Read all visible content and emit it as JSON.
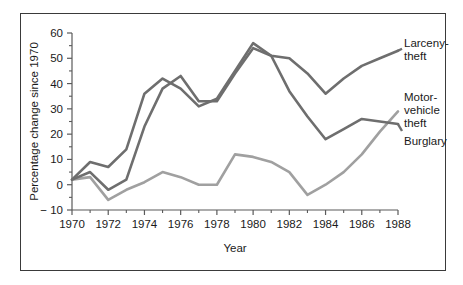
{
  "chart_data": {
    "type": "line",
    "title": "",
    "xlabel": "Year",
    "ylabel": "Percentage change since 1970",
    "xlim": [
      1970,
      1988
    ],
    "ylim": [
      -10,
      60
    ],
    "grid": false,
    "legend_position": "right-inline-labels",
    "x": [
      1970,
      1971,
      1972,
      1973,
      1974,
      1975,
      1976,
      1977,
      1978,
      1979,
      1980,
      1981,
      1982,
      1983,
      1984,
      1985,
      1986,
      1987,
      1988
    ],
    "xticks_major": [
      1970,
      1972,
      1974,
      1976,
      1978,
      1980,
      1982,
      1984,
      1986,
      1988
    ],
    "xticks_minor": [
      1971,
      1973,
      1975,
      1977,
      1979,
      1981,
      1983,
      1985,
      1987
    ],
    "xticklabels": [
      "1970",
      "1972",
      "1974",
      "1976",
      "1978",
      "1980",
      "1982",
      "1984",
      "1986",
      "1988"
    ],
    "yticks_major": [
      -10,
      0,
      10,
      20,
      30,
      40,
      50,
      60
    ],
    "yticks_minor": [
      -5,
      5,
      15,
      25,
      35,
      45,
      55
    ],
    "yticklabels": [
      "− 10",
      "0",
      "10",
      "20",
      "30",
      "40",
      "50",
      "60"
    ],
    "series": [
      {
        "name": "Larceny-theft",
        "label": "Larceny-\ntheft",
        "label_line1": "Larceny-",
        "label_line2": "theft",
        "color": "#6e6e6e",
        "values": [
          2,
          5,
          -2,
          2,
          23,
          38,
          43,
          33,
          33,
          44,
          54,
          51,
          50,
          44,
          36,
          42,
          47,
          50,
          53
        ]
      },
      {
        "name": "Motor-vehicle theft",
        "label": "Motor-\nvehicle\ntheft",
        "label_line1": "Motor-",
        "label_line2": "vehicle",
        "label_line3": "theft",
        "color": "#6e6e6e",
        "values": [
          2,
          9,
          7,
          14,
          36,
          42,
          38,
          31,
          34,
          45,
          56,
          51,
          37,
          27,
          18,
          22,
          26,
          25,
          24
        ]
      },
      {
        "name": "Burglary",
        "label": "Burglary",
        "color": "#a0a0a0",
        "values": [
          2,
          3,
          -6,
          -2,
          1,
          5,
          3,
          0,
          0,
          12,
          11,
          9,
          5,
          -4,
          0,
          5,
          12,
          21,
          29
        ]
      }
    ]
  },
  "annotations": {
    "larceny_label_line1": "Larceny-",
    "larceny_label_line2": "theft",
    "motor_label_line1": "Motor-",
    "motor_label_line2": "vehicle",
    "motor_label_line3": "theft",
    "burglary_label": "Burglary"
  }
}
